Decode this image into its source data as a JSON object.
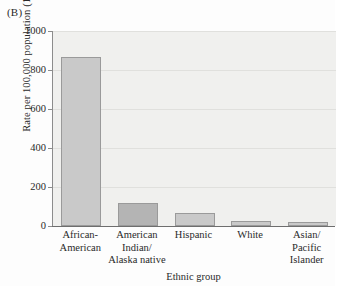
{
  "figure": {
    "panel_label": "(B)",
    "background_color": "#f0f0ee",
    "bar_fill_light": "#c9c9c9",
    "bar_fill_dark": "#b4b4b4",
    "bar_edge_color": "#9a9a9a",
    "axis_color": "#6e6e6e",
    "grid_color": "#e0e0dd"
  },
  "chart_data": {
    "type": "bar",
    "title": "",
    "xlabel": "Ethnic group",
    "ylabel": "Rate per 100,000 population (1998)",
    "categories": [
      "African-American",
      "American Indian/ Alaska native",
      "Hispanic",
      "White",
      "Asian/ Pacific Islander"
    ],
    "category_lines": [
      [
        "African-",
        "American"
      ],
      [
        "American",
        "Indian/",
        "Alaska native"
      ],
      [
        "Hispanic"
      ],
      [
        "White"
      ],
      [
        "Asian/",
        "Pacific",
        "Islander"
      ]
    ],
    "values": [
      865,
      118,
      67,
      26,
      21
    ],
    "ylim": [
      0,
      1000
    ],
    "yticks": [
      0,
      200,
      400,
      600,
      800,
      1000
    ],
    "ytick_labels": [
      "0",
      "200",
      "400",
      "600",
      "800",
      "1000"
    ],
    "grid": true,
    "legend": null
  }
}
